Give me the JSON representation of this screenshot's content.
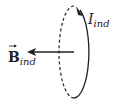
{
  "diagram": {
    "current_label": {
      "main": "I",
      "subscript": "ind"
    },
    "field_label": {
      "main": "B",
      "subscript": "ind",
      "vector": true
    },
    "colors": {
      "stroke": "#222222",
      "background": "#ffffff"
    },
    "loop": {
      "shape": "ellipse",
      "back_half": "dashed",
      "front_half": "solid",
      "direction_arrow": "top, pointing up-left"
    },
    "field_arrow": {
      "direction": "left"
    }
  }
}
